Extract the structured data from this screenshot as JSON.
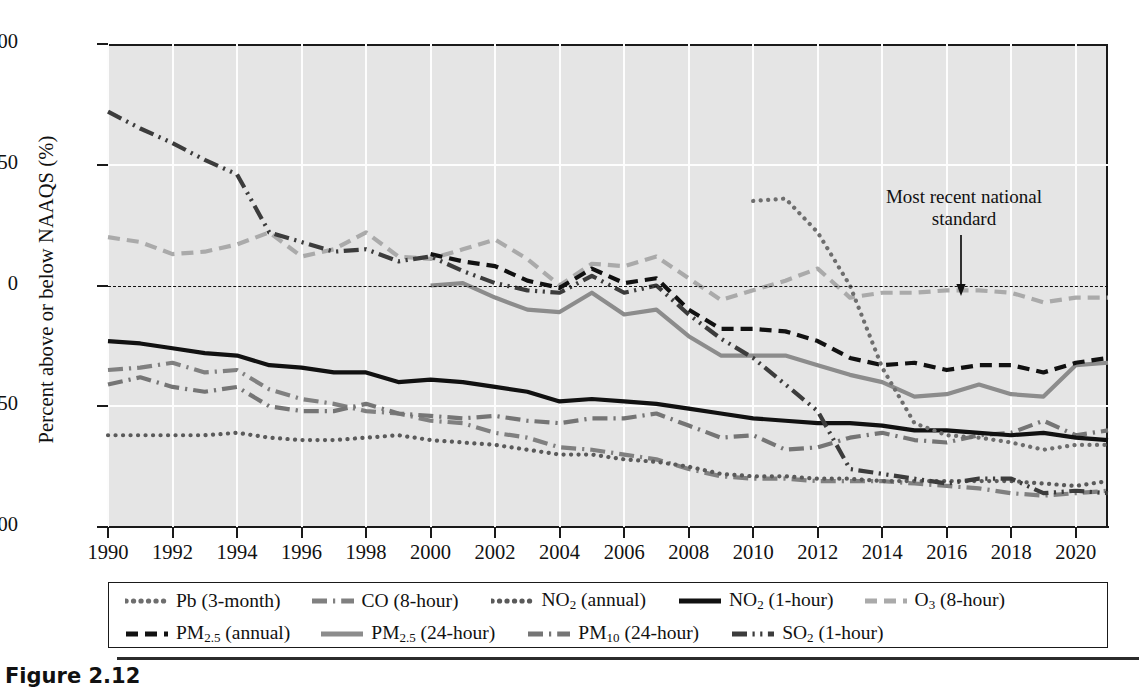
{
  "figure": {
    "caption": "Figure 2.12"
  },
  "chart_data": {
    "type": "line",
    "title": "",
    "xlabel": "",
    "ylabel": "Percent above or below NAAQS (%)",
    "xlim": [
      1990,
      2021
    ],
    "ylim": [
      -100,
      100
    ],
    "yticks": [
      100,
      50,
      0,
      -50,
      -100
    ],
    "ytick_labels": [
      "100",
      "50",
      "0",
      "−50",
      "−100"
    ],
    "xticks": [
      1990,
      1992,
      1994,
      1996,
      1998,
      2000,
      2002,
      2004,
      2006,
      2008,
      2010,
      2012,
      2014,
      2016,
      2018,
      2020
    ],
    "xtick_labels": [
      "1990",
      "1992",
      "1994",
      "1996",
      "1998",
      "2000",
      "2002",
      "2004",
      "2006",
      "2008",
      "2010",
      "2012",
      "2014",
      "2016",
      "2018",
      "2020"
    ],
    "grid": "vertical-and-horizontal-white",
    "legend_position": "below-plot",
    "reference_line": {
      "y": 0,
      "style": "dashed",
      "label": "NAAQS"
    },
    "annotations": [
      {
        "text": "Most recent national standard",
        "x": 2016,
        "y": 0,
        "arrow": "down"
      }
    ],
    "series": [
      {
        "name": "Pb (3-month)",
        "style": "dotted",
        "color": "#6e6e6e",
        "x": [
          2010,
          2011,
          2012,
          2013,
          2014,
          2015,
          2016,
          2017,
          2018,
          2019,
          2020,
          2021
        ],
        "values": [
          35,
          36,
          22,
          0,
          -34,
          -57,
          -62,
          -63,
          -65,
          -68,
          -66,
          -66
        ]
      },
      {
        "name": "CO (8-hour)",
        "style": "dash-dot",
        "color": "#808080",
        "x": [
          1990,
          1991,
          1992,
          1993,
          1994,
          1995,
          1996,
          1997,
          1998,
          1999,
          2000,
          2001,
          2002,
          2003,
          2004,
          2005,
          2006,
          2007,
          2008,
          2009,
          2010,
          2011,
          2012,
          2013,
          2014,
          2015,
          2016,
          2017,
          2018,
          2019,
          2020,
          2021
        ],
        "values": [
          -35,
          -34,
          -32,
          -36,
          -35,
          -43,
          -47,
          -49,
          -52,
          -53,
          -56,
          -57,
          -61,
          -63,
          -67,
          -68,
          -70,
          -72,
          -76,
          -79,
          -80,
          -80,
          -81,
          -81,
          -81,
          -82,
          -83,
          -84,
          -86,
          -87,
          -86,
          -85
        ]
      },
      {
        "name": "NO2 (annual)",
        "style": "dotted",
        "color": "#5a5a5a",
        "x": [
          1990,
          1991,
          1992,
          1993,
          1994,
          1995,
          1996,
          1997,
          1998,
          1999,
          2000,
          2001,
          2002,
          2003,
          2004,
          2005,
          2006,
          2007,
          2008,
          2009,
          2010,
          2011,
          2012,
          2013,
          2014,
          2015,
          2016,
          2017,
          2018,
          2019,
          2020,
          2021
        ],
        "values": [
          -62,
          -62,
          -62,
          -62,
          -61,
          -63,
          -64,
          -64,
          -63,
          -62,
          -64,
          -65,
          -66,
          -68,
          -70,
          -70,
          -72,
          -73,
          -75,
          -78,
          -79,
          -79,
          -80,
          -80,
          -81,
          -81,
          -81,
          -81,
          -81,
          -82,
          -83,
          -81
        ]
      },
      {
        "name": "NO2 (1-hour)",
        "style": "solid",
        "color": "#111111",
        "x": [
          1990,
          1991,
          1992,
          1993,
          1994,
          1995,
          1996,
          1997,
          1998,
          1999,
          2000,
          2001,
          2002,
          2003,
          2004,
          2005,
          2006,
          2007,
          2008,
          2009,
          2010,
          2011,
          2012,
          2013,
          2014,
          2015,
          2016,
          2017,
          2018,
          2019,
          2020,
          2021
        ],
        "values": [
          -23,
          -24,
          -26,
          -28,
          -29,
          -33,
          -34,
          -36,
          -36,
          -40,
          -39,
          -40,
          -42,
          -44,
          -48,
          -47,
          -48,
          -49,
          -51,
          -53,
          -55,
          -56,
          -57,
          -57,
          -58,
          -60,
          -60,
          -61,
          -62,
          -61,
          -63,
          -64
        ]
      },
      {
        "name": "O3 (8-hour)",
        "style": "dashed",
        "color": "#aaaaaa",
        "x": [
          1990,
          1991,
          1992,
          1993,
          1994,
          1995,
          1996,
          1997,
          1998,
          1999,
          2000,
          2001,
          2002,
          2003,
          2004,
          2005,
          2006,
          2007,
          2008,
          2009,
          2010,
          2011,
          2012,
          2013,
          2014,
          2015,
          2016,
          2017,
          2018,
          2019,
          2020,
          2021
        ],
        "values": [
          20,
          18,
          13,
          14,
          17,
          22,
          12,
          15,
          22,
          12,
          11,
          15,
          19,
          11,
          0,
          9,
          8,
          12,
          3,
          -6,
          -2,
          2,
          7,
          -5,
          -3,
          -3,
          -2,
          -2,
          -3,
          -7,
          -5,
          -5
        ]
      },
      {
        "name": "PM2.5 (annual)",
        "style": "dashed",
        "color": "#111111",
        "x": [
          2000,
          2001,
          2002,
          2003,
          2004,
          2005,
          2006,
          2007,
          2008,
          2009,
          2010,
          2011,
          2012,
          2013,
          2014,
          2015,
          2016,
          2017,
          2018,
          2019,
          2020,
          2021
        ],
        "values": [
          13,
          10,
          8,
          2,
          -1,
          7,
          1,
          3,
          -10,
          -18,
          -18,
          -19,
          -23,
          -30,
          -33,
          -32,
          -35,
          -33,
          -33,
          -36,
          -32,
          -30
        ]
      },
      {
        "name": "PM2.5 (24-hour)",
        "style": "solid",
        "color": "#8c8c8c",
        "x": [
          2000,
          2001,
          2002,
          2003,
          2004,
          2005,
          2006,
          2007,
          2008,
          2009,
          2010,
          2011,
          2012,
          2013,
          2014,
          2015,
          2016,
          2017,
          2018,
          2019,
          2020,
          2021
        ],
        "values": [
          0,
          1,
          -5,
          -10,
          -11,
          -3,
          -12,
          -10,
          -21,
          -29,
          -29,
          -29,
          -33,
          -37,
          -40,
          -46,
          -45,
          -41,
          -45,
          -46,
          -33,
          -32
        ]
      },
      {
        "name": "PM10 (24-hour)",
        "style": "dash-dot",
        "color": "#757575",
        "x": [
          1990,
          1991,
          1992,
          1993,
          1994,
          1995,
          1996,
          1997,
          1998,
          1999,
          2000,
          2001,
          2002,
          2003,
          2004,
          2005,
          2006,
          2007,
          2008,
          2009,
          2010,
          2011,
          2012,
          2013,
          2014,
          2015,
          2016,
          2017,
          2018,
          2019,
          2020,
          2021
        ],
        "values": [
          -41,
          -38,
          -42,
          -44,
          -42,
          -50,
          -52,
          -52,
          -49,
          -53,
          -54,
          -55,
          -54,
          -56,
          -57,
          -55,
          -55,
          -53,
          -58,
          -63,
          -62,
          -68,
          -67,
          -63,
          -61,
          -64,
          -65,
          -62,
          -61,
          -56,
          -62,
          -60
        ]
      },
      {
        "name": "SO2 (1-hour)",
        "style": "dash-dot-dot",
        "color": "#3c3c3c",
        "x": [
          1990,
          1991,
          1992,
          1993,
          1994,
          1995,
          1996,
          1997,
          1998,
          1999,
          2000,
          2001,
          2002,
          2003,
          2004,
          2005,
          2006,
          2007,
          2008,
          2009,
          2010,
          2011,
          2012,
          2013,
          2014,
          2015,
          2016,
          2017,
          2018,
          2019,
          2020,
          2021
        ],
        "values": [
          72,
          65,
          59,
          52,
          46,
          22,
          18,
          14,
          15,
          10,
          12,
          6,
          1,
          -2,
          -3,
          4,
          -3,
          0,
          -12,
          -22,
          -30,
          -41,
          -52,
          -76,
          -78,
          -80,
          -82,
          -80,
          -80,
          -86,
          -85,
          -86
        ]
      }
    ]
  },
  "axis": {
    "y_title": "Percent above or below NAAQS (%)"
  },
  "annotation": {
    "line1": "Most recent national",
    "line2": "standard"
  },
  "legend": {
    "row1": [
      {
        "label_html": "Pb (3-month)",
        "style": "dotted",
        "color": "#6e6e6e"
      },
      {
        "label_html": "CO (8-hour)",
        "style": "dash-dot",
        "color": "#808080"
      },
      {
        "label_html": "NO<sub>2</sub> (annual)",
        "style": "dotted",
        "color": "#5a5a5a"
      },
      {
        "label_html": "NO<sub>2</sub> (1-hour)",
        "style": "solid",
        "color": "#111111"
      },
      {
        "label_html": "O<sub>3</sub> (8-hour)",
        "style": "dashed",
        "color": "#aaaaaa"
      }
    ],
    "row2": [
      {
        "label_html": "PM<sub>2.5</sub> (annual)",
        "style": "dashed",
        "color": "#111111"
      },
      {
        "label_html": "PM<sub>2.5</sub> (24-hour)",
        "style": "solid",
        "color": "#8c8c8c"
      },
      {
        "label_html": "PM<sub>10</sub> (24-hour)",
        "style": "dash-dot",
        "color": "#757575"
      },
      {
        "label_html": "SO<sub>2</sub> (1-hour)",
        "style": "dash-dot-dot",
        "color": "#3c3c3c"
      }
    ]
  }
}
